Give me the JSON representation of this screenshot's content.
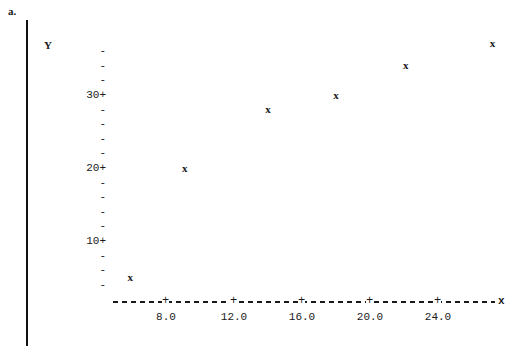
{
  "part_label": "a.",
  "chart_data": {
    "type": "scatter",
    "title": "",
    "xlabel": "x",
    "ylabel": "Y",
    "grid": false,
    "legend": null,
    "marker": "x",
    "xlim": [
      4.0,
      28.5
    ],
    "ylim": [
      0,
      40
    ],
    "x_ticks": [
      8.0,
      12.0,
      16.0,
      20.0,
      24.0
    ],
    "x_tick_labels": [
      "8.0",
      "12.0",
      "16.0",
      "20.0",
      "24.0"
    ],
    "y_ticks": [
      10,
      20,
      30
    ],
    "y_tick_labels": [
      "10+",
      "20+",
      "30+"
    ],
    "y_minor_tick_mark": "-",
    "x_tick_mark": "+",
    "axis_style": "dashed",
    "points": [
      {
        "x": 5.9,
        "y": 5
      },
      {
        "x": 9.1,
        "y": 20
      },
      {
        "x": 14.0,
        "y": 28
      },
      {
        "x": 18.0,
        "y": 30
      },
      {
        "x": 22.1,
        "y": 34
      },
      {
        "x": 27.2,
        "y": 37
      }
    ]
  },
  "colors": {
    "ink": "#1a1a1a",
    "background": "#ffffff"
  }
}
